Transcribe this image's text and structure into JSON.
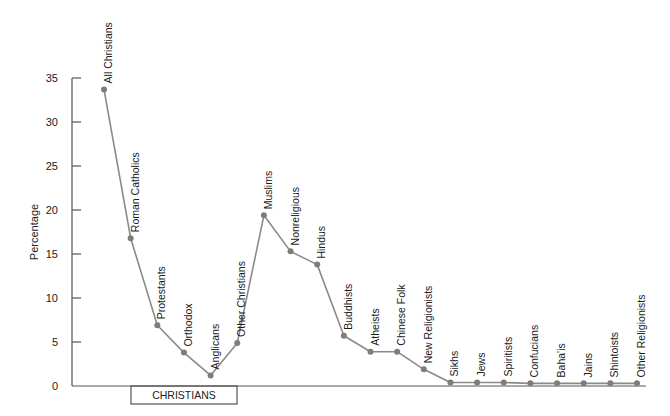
{
  "chart_data": {
    "type": "line",
    "title": "",
    "xlabel": "",
    "ylabel": "Percentage",
    "ylim": [
      0,
      35
    ],
    "yticks": [
      0,
      5,
      10,
      15,
      20,
      25,
      30,
      35
    ],
    "grid": false,
    "legend": null,
    "categories": [
      "All Christians",
      "Roman Catholics",
      "Protestants",
      "Orthodox",
      "Anglicans",
      "Other Christians",
      "Muslims",
      "Nonreligious",
      "Hindus",
      "Buddhists",
      "Atheists",
      "Chinese Folk",
      "New Religionists",
      "Sikhs",
      "Jews",
      "Spiritists",
      "Confucians",
      "Baha'is",
      "Jains",
      "Shintoists",
      "Other Religionists"
    ],
    "values": [
      33.7,
      16.8,
      6.9,
      3.8,
      1.2,
      4.9,
      19.4,
      15.3,
      13.8,
      5.7,
      3.9,
      3.9,
      1.9,
      0.4,
      0.4,
      0.4,
      0.3,
      0.3,
      0.3,
      0.3,
      0.3
    ],
    "annotations": [
      {
        "text": "CHRISTIANS",
        "type": "bracket-box",
        "spans": [
          "Roman Catholics",
          "Other Christians"
        ]
      }
    ]
  },
  "colors": {
    "line": "#8a8a8a",
    "marker": "#7d7d7d",
    "axis": "#555555",
    "text": "#222222"
  }
}
